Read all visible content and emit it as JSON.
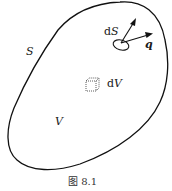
{
  "figure": {
    "caption": "图 8.1",
    "labels": {
      "surface": "S",
      "volume": "V",
      "surface_element_prefix": "d",
      "surface_element_var": "S",
      "volume_element_prefix": "d",
      "volume_element_var": "V",
      "flux_vector": "q"
    },
    "elements": [
      {
        "name": "closed-surface-boundary",
        "type": "closed-curve"
      },
      {
        "name": "surface-element-ellipse",
        "type": "ellipse"
      },
      {
        "name": "normal-vector-arrow",
        "type": "arrow"
      },
      {
        "name": "flux-vector-arrow",
        "type": "arrow"
      },
      {
        "name": "volume-element-cube",
        "type": "dotted-cube"
      }
    ],
    "colors": {
      "stroke": "#111111",
      "background": "#ffffff"
    }
  }
}
